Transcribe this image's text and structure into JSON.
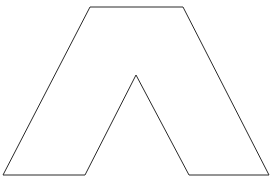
{
  "diagram": {
    "type": "polygon-outline",
    "shape_name": "A-frame / inverted-V polygon",
    "background": "#ffffff",
    "stroke_color": "#2a2a2a",
    "fill_color": "#ffffff",
    "stroke_width": 1,
    "vertices": [
      [
        90,
        7
      ],
      [
        183,
        7
      ],
      [
        269,
        175
      ],
      [
        189,
        175
      ],
      [
        136,
        75
      ],
      [
        85,
        175
      ],
      [
        3,
        175
      ]
    ]
  }
}
